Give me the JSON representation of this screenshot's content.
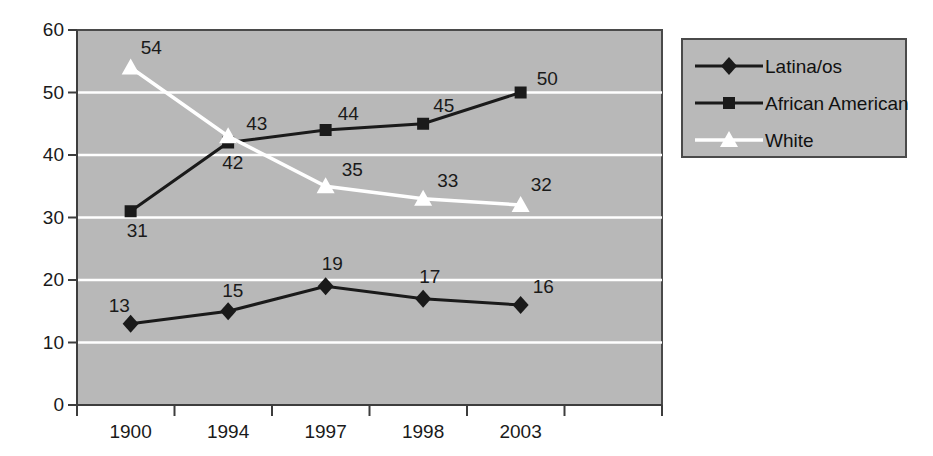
{
  "chart_data": {
    "type": "line",
    "title": "",
    "subtitle": "",
    "xlabel": "",
    "ylabel": "",
    "categories": [
      "1900",
      "1994",
      "1997",
      "1998",
      "2003"
    ],
    "ylim": [
      0,
      60
    ],
    "yticks": [
      "0",
      "10",
      "20",
      "30",
      "40",
      "50",
      "60"
    ],
    "ytick_step": 10,
    "grid": "horizontal-only",
    "legend_position": "right",
    "plot_background": "#b8b8b8",
    "gridline_color": "#ffffff",
    "series": [
      {
        "name": "Latina/os",
        "marker": "diamond",
        "color": "#1a1a1a",
        "line_color": "#1a1a1a",
        "values": [
          13,
          15,
          19,
          17,
          16
        ],
        "labels": [
          "13",
          "15",
          "19",
          "17",
          "16"
        ]
      },
      {
        "name": "African American",
        "marker": "square",
        "color": "#1a1a1a",
        "line_color": "#1a1a1a",
        "values": [
          31,
          42,
          44,
          45,
          50
        ],
        "labels": [
          "31",
          "42",
          "44",
          "45",
          "50"
        ]
      },
      {
        "name": "White",
        "marker": "triangle",
        "color": "#ffffff",
        "line_color": "#ffffff",
        "values": [
          54,
          43,
          35,
          33,
          32
        ],
        "labels": [
          "54",
          "43",
          "35",
          "33",
          "32"
        ]
      }
    ]
  },
  "axes": {
    "y_ticks": [
      {
        "label": "60"
      },
      {
        "label": "50"
      },
      {
        "label": "40"
      },
      {
        "label": "30"
      },
      {
        "label": "20"
      },
      {
        "label": "10"
      },
      {
        "label": "0"
      }
    ],
    "x_ticks": [
      {
        "label": "1900"
      },
      {
        "label": "1994"
      },
      {
        "label": "1997"
      },
      {
        "label": "1998"
      },
      {
        "label": "2003"
      }
    ]
  },
  "legend": {
    "entries": [
      {
        "label": "Latina/os",
        "marker": "diamond"
      },
      {
        "label": "African American",
        "marker": "square"
      },
      {
        "label": "White",
        "marker": "triangle"
      }
    ]
  },
  "data_labels": {
    "latinaos": [
      "13",
      "15",
      "19",
      "17",
      "16"
    ],
    "african_american": [
      "31",
      "42",
      "44",
      "45",
      "50"
    ],
    "white": [
      "54",
      "43",
      "35",
      "33",
      "32"
    ]
  }
}
